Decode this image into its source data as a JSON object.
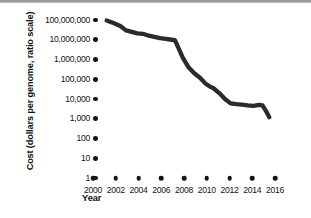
{
  "figure": {
    "background_color": "#ffffff",
    "line_color": "#2b2b2d",
    "text_color": "#141414",
    "top_artifact_color": "#9a9a9c"
  },
  "axes": {
    "y_title": "Cost (dollars per genome, ratio scale)",
    "x_title": "Year",
    "y_tick_labels": [
      "100,000,000",
      "10,000,000",
      "1,000,000",
      "100,000",
      "10,000",
      "1,000",
      "100",
      "10",
      "1"
    ],
    "x_tick_labels": [
      "2000",
      "2002",
      "2004",
      "2006",
      "2008",
      "2010",
      "2012",
      "2014",
      "2016"
    ]
  },
  "chart_data": {
    "type": "line",
    "title": "",
    "subtitle": "",
    "xlabel": "Year",
    "ylabel": "Cost (dollars per genome, ratio scale)",
    "yscale": "log",
    "xscale": "linear",
    "grid": false,
    "legend": false,
    "legend_position": "none",
    "xlim": [
      2000,
      2016
    ],
    "ylim": [
      1,
      100000000
    ],
    "y_ticks": [
      1,
      10,
      100,
      1000,
      10000,
      100000,
      1000000,
      10000000,
      100000000
    ],
    "y_tick_labels": [
      "1",
      "10",
      "100",
      "1,000",
      "10,000",
      "100,000",
      "1,000,000",
      "10,000,000",
      "100,000,000"
    ],
    "x_ticks": [
      2000,
      2002,
      2004,
      2006,
      2008,
      2010,
      2012,
      2014,
      2016
    ],
    "x_tick_labels": [
      "2000",
      "2002",
      "2004",
      "2006",
      "2008",
      "2010",
      "2012",
      "2014",
      "2016"
    ],
    "series": [
      {
        "name": "Cost per genome",
        "x": [
          2001.2,
          2001.8,
          2002.4,
          2002.9,
          2003.4,
          2003.9,
          2004.4,
          2004.9,
          2005.4,
          2005.9,
          2006.4,
          2006.9,
          2007.2,
          2007.5,
          2007.9,
          2008.4,
          2008.9,
          2009.4,
          2009.9,
          2010.2,
          2010.6,
          2011.1,
          2011.6,
          2012.1,
          2012.6,
          2013.1,
          2013.6,
          2014.1,
          2014.6,
          2014.9,
          2015.2,
          2015.5
        ],
        "y": [
          95000000,
          70000000,
          50000000,
          30000000,
          25000000,
          21000000,
          20000000,
          16000000,
          14000000,
          12000000,
          11000000,
          10000000,
          9500000,
          4000000,
          1200000,
          400000,
          200000,
          120000,
          60000,
          45000,
          35000,
          20000,
          10000,
          6000,
          5500,
          5200,
          4800,
          4500,
          5000,
          4800,
          2500,
          1200
        ]
      }
    ]
  }
}
